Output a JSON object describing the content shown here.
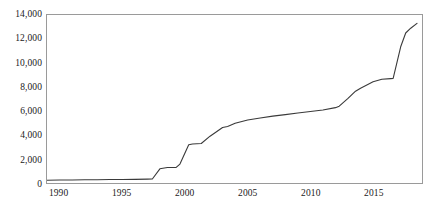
{
  "chart_data": {
    "type": "line",
    "title": "",
    "subtitle": "",
    "xlabel": "",
    "ylabel": "",
    "xlim": [
      1989,
      1990,
      2018.6
    ],
    "ylim": [
      0,
      14000
    ],
    "grid": false,
    "legend": null,
    "legend_position": "none",
    "y_ticks": [
      0,
      2000,
      4000,
      6000,
      8000,
      10000,
      12000,
      14000
    ],
    "y_tick_labels": [
      "0",
      "2,000",
      "4,000",
      "6,000",
      "8,000",
      "10,000",
      "12,000",
      "14,000"
    ],
    "x_ticks": [
      1990,
      1995,
      2000,
      2005,
      2010,
      2015
    ],
    "x_tick_labels": [
      "1990",
      "1995",
      "2000",
      "2005",
      "2010",
      "2015"
    ],
    "x_axis_min": 1989.0,
    "x_axis_max": 2018.9,
    "line_color": "#3a3a3a",
    "line_width": 1.1,
    "axis_color": "#9a9a9a",
    "text_color": "#1a1a1a",
    "background_color": "#ffffff",
    "series": [
      {
        "name": "series-1",
        "x": [
          1989,
          1990,
          1991,
          1992,
          1993,
          1994,
          1995,
          1996,
          1997,
          1997.4,
          1998,
          1998.6,
          1999.3,
          1999.6,
          2000.3,
          2000.6,
          2001.3,
          2002,
          2003,
          2003.4,
          2004,
          2005,
          2006,
          2007,
          2008,
          2009,
          2010,
          2011,
          2012,
          2012.3,
          2013,
          2013.6,
          2014,
          2015,
          2015.7,
          2016.4,
          2016.6,
          2017.2,
          2017.6,
          2018,
          2018.5
        ],
        "y": [
          230,
          245,
          255,
          265,
          275,
          285,
          295,
          305,
          320,
          330,
          1180,
          1290,
          1300,
          1580,
          3180,
          3250,
          3290,
          3900,
          4620,
          4710,
          4980,
          5250,
          5420,
          5570,
          5700,
          5830,
          5960,
          6080,
          6280,
          6400,
          7050,
          7650,
          7900,
          8430,
          8640,
          8700,
          8720,
          11350,
          12500,
          12900,
          13300
        ]
      }
    ]
  }
}
